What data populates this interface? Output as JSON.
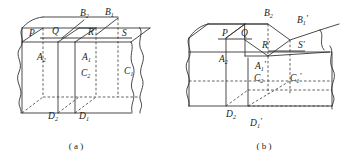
{
  "figure": {
    "background_color": "#ffffff",
    "line_color": "#2b2b2b",
    "hidden_line_color": "#3a3a3a"
  },
  "panels": [
    {
      "id": "a",
      "caption": "( a )",
      "description": "Uncut rectangular prism with three vertical section planes",
      "labels": [
        {
          "name": "label-P",
          "base": "P",
          "sub": "",
          "prime": "",
          "x": 29,
          "y": 36
        },
        {
          "name": "label-Q",
          "base": "Q",
          "sub": "",
          "prime": "",
          "x": 52,
          "y": 34
        },
        {
          "name": "label-R",
          "base": "R",
          "sub": "",
          "prime": "",
          "x": 88,
          "y": 35
        },
        {
          "name": "label-S",
          "base": "S",
          "sub": "",
          "prime": "",
          "x": 122,
          "y": 36
        },
        {
          "name": "label-B2",
          "base": "B",
          "sub": "2",
          "prime": "",
          "x": 80,
          "y": 16
        },
        {
          "name": "label-B1",
          "base": "B",
          "sub": "1",
          "prime": "",
          "x": 105,
          "y": 15
        },
        {
          "name": "label-A2",
          "base": "A",
          "sub": "2",
          "prime": "",
          "x": 37,
          "y": 60
        },
        {
          "name": "label-A1",
          "base": "A",
          "sub": "1",
          "prime": "",
          "x": 82,
          "y": 60
        },
        {
          "name": "label-C2",
          "base": "C",
          "sub": "2",
          "prime": "",
          "x": 81,
          "y": 76
        },
        {
          "name": "label-C1",
          "base": "C",
          "sub": "1",
          "prime": "",
          "x": 124,
          "y": 74
        },
        {
          "name": "label-D2",
          "base": "D",
          "sub": "2",
          "prime": "",
          "x": 48,
          "y": 119
        },
        {
          "name": "label-D1",
          "base": "D",
          "sub": "1",
          "prime": "",
          "x": 79,
          "y": 119
        }
      ]
    },
    {
      "id": "b",
      "caption": "( b )",
      "description": "Same block with a stepped notch removed, primed vertex labels",
      "labels": [
        {
          "name": "label-P-b",
          "base": "P",
          "sub": "",
          "prime": "",
          "x": 222,
          "y": 36
        },
        {
          "name": "label-Q-b",
          "base": "Q",
          "sub": "",
          "prime": "",
          "x": 241,
          "y": 36
        },
        {
          "name": "label-R-prime",
          "base": "R",
          "sub": "",
          "prime": "'",
          "x": 262,
          "y": 48
        },
        {
          "name": "label-S-prime",
          "base": "S",
          "sub": "",
          "prime": "'",
          "x": 298,
          "y": 48
        },
        {
          "name": "label-B2-b",
          "base": "B",
          "sub": "2",
          "prime": "",
          "x": 264,
          "y": 16
        },
        {
          "name": "label-B1-prime",
          "base": "B",
          "sub": "1",
          "prime": "'",
          "x": 297,
          "y": 23
        },
        {
          "name": "label-A2-b",
          "base": "A",
          "sub": "2",
          "prime": "",
          "x": 219,
          "y": 62
        },
        {
          "name": "label-A1-prime",
          "base": "A",
          "sub": "1",
          "prime": "'",
          "x": 255,
          "y": 69
        },
        {
          "name": "label-C2-b",
          "base": "C",
          "sub": "2",
          "prime": "",
          "x": 254,
          "y": 81
        },
        {
          "name": "label-C1-prime",
          "base": "C",
          "sub": "1",
          "prime": "'",
          "x": 290,
          "y": 81
        },
        {
          "name": "label-D2-b",
          "base": "D",
          "sub": "2",
          "prime": "",
          "x": 226,
          "y": 117
        },
        {
          "name": "label-D1-prime",
          "base": "D",
          "sub": "1",
          "prime": "'",
          "x": 250,
          "y": 126
        }
      ]
    }
  ],
  "captions": {
    "a": "( a )",
    "b": "( b )"
  }
}
